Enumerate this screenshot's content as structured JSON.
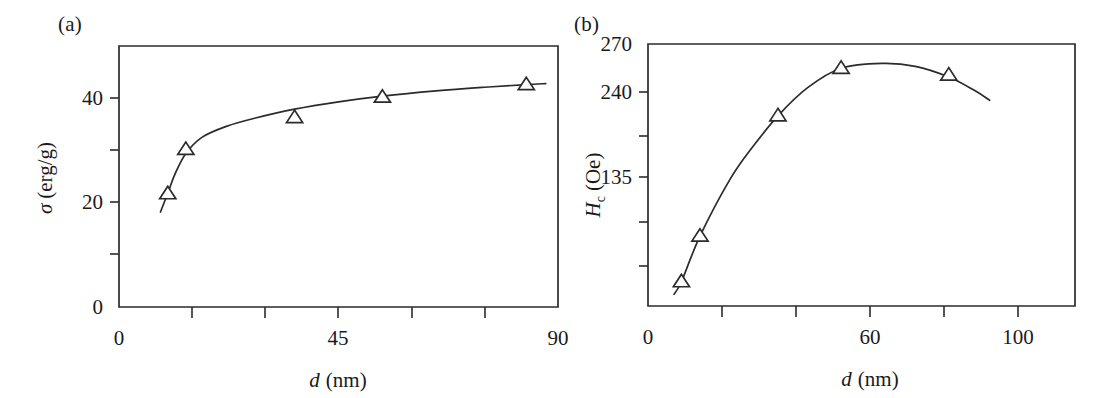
{
  "figure": {
    "background_color": "#ffffff",
    "ink_color": "#2b2b2b",
    "width": 1117,
    "height": 398
  },
  "panels": {
    "a": {
      "label": "(a)",
      "ylabel_symbol": "σ",
      "ylabel_unit": "(erg/g)",
      "xlabel_symbol": "d",
      "xlabel_unit": "(nm)",
      "x_tick_labels": [
        "0",
        "45",
        "90"
      ],
      "y_tick_labels": [
        "0",
        "20",
        "40"
      ]
    },
    "b": {
      "label": "(b)",
      "ylabel_symbol": "H",
      "ylabel_subscript": "c",
      "ylabel_unit": "(Oe)",
      "xlabel_symbol": "d",
      "xlabel_unit": "(nm)",
      "x_tick_labels": [
        "0",
        "60",
        "100"
      ],
      "y_tick_labels": [
        "135",
        "240",
        "270"
      ]
    }
  },
  "chart_data": [
    {
      "id": "panel-a",
      "type": "scatter",
      "title": "(a)",
      "xlabel": "d (nm)",
      "ylabel": "σ (erg/g)",
      "xlim": [
        0,
        90
      ],
      "ylim": [
        0,
        50
      ],
      "xticks": [
        0,
        15,
        30,
        45,
        60,
        75,
        90
      ],
      "xticklabels": [
        "0",
        "",
        "",
        "45",
        "",
        "",
        "90"
      ],
      "yticks": [
        0,
        10,
        20,
        30,
        40
      ],
      "yticklabels": [
        "0",
        "",
        "20",
        "",
        "40"
      ],
      "grid": false,
      "legend": false,
      "marker": "open-triangle-up",
      "x": [
        10.0,
        13.7,
        36.0,
        54.0,
        83.5
      ],
      "y": [
        21.7,
        30.2,
        36.3,
        40.2,
        42.6
      ],
      "fit_curve": {
        "note": "smooth saturating curve through points",
        "x": [
          8.5,
          10.0,
          11.5,
          13.7,
          17.0,
          22.0,
          28.0,
          36.0,
          45.0,
          54.0,
          65.0,
          75.0,
          83.5,
          87.5
        ],
        "y": [
          18.2,
          21.8,
          25.5,
          29.4,
          32.5,
          34.6,
          36.2,
          37.9,
          39.3,
          40.4,
          41.4,
          42.1,
          42.6,
          42.8
        ]
      }
    },
    {
      "id": "panel-b",
      "type": "scatter",
      "title": "(b)",
      "xlabel": "d (nm)",
      "ylabel": "H_c (Oe)",
      "xlim": [
        0,
        115
      ],
      "ylim": [
        0,
        270
      ],
      "xticks": [
        0,
        20,
        40,
        60,
        80,
        100
      ],
      "xticklabels": [
        "0",
        "",
        "",
        "60",
        "",
        "100"
      ],
      "yticks": [
        0,
        45,
        90,
        135,
        180,
        240,
        270
      ],
      "yticklabels": [
        "",
        "",
        "",
        "135",
        "",
        "240",
        "270"
      ],
      "grid": false,
      "legend": false,
      "marker": "open-triangle-up",
      "x": [
        9.0,
        14.0,
        35.0,
        52.0,
        81.0
      ],
      "y": [
        25.0,
        72.0,
        196.0,
        245.0,
        238.0
      ],
      "fit_curve": {
        "note": "smooth peaked curve, maximum near d = 63 nm",
        "x": [
          7.0,
          9.0,
          14.0,
          22.0,
          28.0,
          35.0,
          43.0,
          52.0,
          63.0,
          72.0,
          81.0,
          88.0,
          92.0
        ],
        "y": [
          12.0,
          25.0,
          72.0,
          130.0,
          163.0,
          196.0,
          225.0,
          245.0,
          250.0,
          247.0,
          236.0,
          222.0,
          212.0
        ]
      }
    }
  ]
}
